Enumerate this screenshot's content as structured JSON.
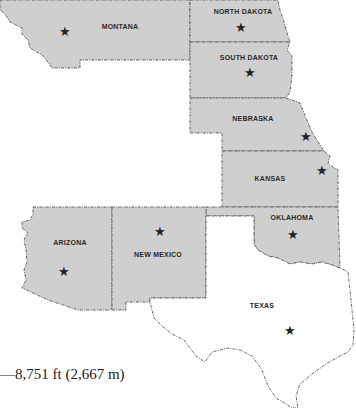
{
  "map": {
    "type": "state map",
    "states": [
      {
        "name": "MONTANA",
        "shaded": true
      },
      {
        "name": "NORTH DAKOTA",
        "shaded": true
      },
      {
        "name": "SOUTH DAKOTA",
        "shaded": true
      },
      {
        "name": "NEBRASKA",
        "shaded": true
      },
      {
        "name": "KANSAS",
        "shaded": true
      },
      {
        "name": "OKLAHOMA",
        "shaded": true
      },
      {
        "name": "ARIZONA",
        "shaded": true
      },
      {
        "name": "NEW MEXICO",
        "shaded": true
      },
      {
        "name": "TEXAS",
        "shaded": false
      }
    ],
    "capital_marker": "★",
    "colors": {
      "shaded_fill": "#cfcfcf",
      "border": "#555555",
      "text": "#2a2a2a"
    }
  },
  "annotation": {
    "elevation_text": "—8,751 ft (2,667 m)"
  }
}
